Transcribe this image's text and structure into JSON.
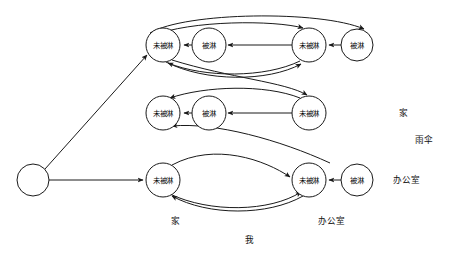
{
  "diagram": {
    "title": "",
    "background_color": "#ffffff",
    "stroke_color": "#1a1a1a",
    "labels": {
      "not_wet": "未被淋",
      "wet": "被淋",
      "home": "家",
      "umbrella": "雨伞",
      "office": "办公室",
      "me": "我"
    },
    "start_node": {
      "label": "",
      "cx": 33,
      "cy": 180,
      "r": 16
    },
    "nodes": [
      {
        "id": "n1",
        "label": "未被淋",
        "cx": 163,
        "cy": 45,
        "r": 17,
        "row": "top",
        "col": 1
      },
      {
        "id": "n2",
        "label": "被淋",
        "cx": 209,
        "cy": 45,
        "r": 17,
        "row": "top",
        "col": 2
      },
      {
        "id": "n3",
        "label": "未被淋",
        "cx": 309,
        "cy": 45,
        "r": 17,
        "row": "top",
        "col": 3
      },
      {
        "id": "n4",
        "label": "被淋",
        "cx": 357,
        "cy": 45,
        "r": 16,
        "row": "top",
        "col": 4
      },
      {
        "id": "n5",
        "label": "未被淋",
        "cx": 163,
        "cy": 113,
        "r": 17,
        "row": "middle",
        "col": 1
      },
      {
        "id": "n6",
        "label": "被淋",
        "cx": 209,
        "cy": 113,
        "r": 17,
        "row": "middle",
        "col": 2
      },
      {
        "id": "n7",
        "label": "未被淋",
        "cx": 309,
        "cy": 113,
        "r": 17,
        "row": "middle",
        "col": 3
      },
      {
        "id": "n8",
        "label": "未被淋",
        "cx": 163,
        "cy": 180,
        "r": 17,
        "row": "bottom",
        "col": 1
      },
      {
        "id": "n9",
        "label": "未被淋",
        "cx": 309,
        "cy": 180,
        "r": 17,
        "row": "bottom",
        "col": 3
      },
      {
        "id": "n10",
        "label": "被淋",
        "cx": 357,
        "cy": 180,
        "r": 16,
        "row": "bottom",
        "col": 4
      }
    ],
    "side_labels": [
      {
        "text": "家",
        "x": 403,
        "y": 113
      },
      {
        "text": "雨伞",
        "x": 424,
        "y": 140
      },
      {
        "text": "办公室",
        "x": 406,
        "y": 180
      }
    ],
    "bottom_labels": [
      {
        "text": "家",
        "x": 175,
        "y": 221
      },
      {
        "text": "办公室",
        "x": 331,
        "y": 221
      },
      {
        "text": "我",
        "x": 249,
        "y": 240
      }
    ],
    "edge_count": 16
  }
}
